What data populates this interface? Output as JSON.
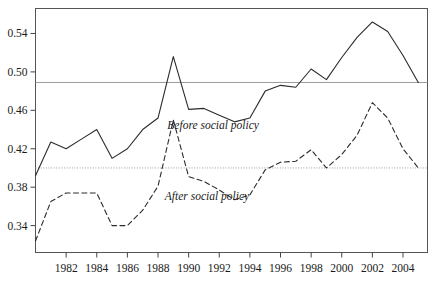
{
  "chart_data": {
    "type": "line",
    "title": "",
    "subtitle": "",
    "xlabel": "",
    "ylabel": "",
    "xlim": [
      1980,
      2005.6
    ],
    "ylim": [
      0.312,
      0.566
    ],
    "grid": false,
    "legend_position": "inline-annotations",
    "x_ticks": [
      1982,
      1984,
      1986,
      1988,
      1990,
      1992,
      1994,
      1996,
      1998,
      2000,
      2002,
      2004
    ],
    "x_tick_labels": [
      "1982",
      "1984",
      "1986",
      "1988",
      "1990",
      "1992",
      "1994",
      "1996",
      "1998",
      "2000",
      "2002",
      "2004"
    ],
    "y_ticks": [
      0.34,
      0.38,
      0.42,
      0.46,
      0.5,
      0.54
    ],
    "y_tick_labels": [
      "0.34",
      "0.38",
      "0.42",
      "0.46",
      "0.50",
      "0.54"
    ],
    "x": [
      1980,
      1981,
      1982,
      1983,
      1984,
      1985,
      1986,
      1987,
      1988,
      1989,
      1990,
      1991,
      1992,
      1993,
      1994,
      1995,
      1996,
      1997,
      1998,
      1999,
      2000,
      2001,
      2002,
      2003,
      2004,
      2005
    ],
    "series": [
      {
        "name": "Before social policy",
        "style": "solid",
        "color": "#2b2b2b",
        "annotation": "Before social policy",
        "annotation_x": 1991.6,
        "annotation_y": 0.441,
        "values": [
          0.392,
          0.427,
          0.42,
          0.43,
          0.44,
          0.41,
          0.42,
          0.44,
          0.452,
          0.516,
          0.461,
          0.462,
          0.455,
          0.448,
          0.452,
          0.48,
          0.486,
          0.484,
          0.503,
          0.492,
          0.515,
          0.536,
          0.552,
          0.542,
          0.517,
          0.489
        ]
      },
      {
        "name": "After social policy",
        "style": "dashed",
        "color": "#2b2b2b",
        "annotation": "After social policy",
        "annotation_x": 1991.2,
        "annotation_y": 0.367,
        "values": [
          0.324,
          0.365,
          0.374,
          0.374,
          0.374,
          0.34,
          0.34,
          0.356,
          0.381,
          0.45,
          0.391,
          0.386,
          0.377,
          0.367,
          0.372,
          0.398,
          0.406,
          0.407,
          0.419,
          0.4,
          0.414,
          0.434,
          0.468,
          0.452,
          0.42,
          0.4
        ]
      }
    ],
    "reference_lines": [
      {
        "name": "before-mean-line",
        "value": 0.489,
        "style": "solid",
        "color": "#9a9a9a"
      },
      {
        "name": "after-mean-line",
        "value": 0.4,
        "style": "dotted",
        "color": "#9a9a9a"
      }
    ]
  }
}
